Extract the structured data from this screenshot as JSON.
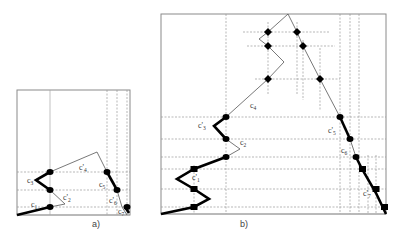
{
  "figure": {
    "panel_a": {
      "caption": "a)",
      "labels": [
        {
          "id": "c1",
          "text": "c",
          "sub": "1",
          "prime": false
        },
        {
          "id": "c2p",
          "text": "c'",
          "sub": "2",
          "prime": true
        },
        {
          "id": "c3",
          "text": "c",
          "sub": "3",
          "prime": false
        },
        {
          "id": "c4p",
          "text": "c'",
          "sub": "4",
          "prime": true
        },
        {
          "id": "c5",
          "text": "c",
          "sub": "5",
          "prime": false
        },
        {
          "id": "c6p",
          "text": "c'",
          "sub": "6",
          "prime": true
        },
        {
          "id": "c7",
          "text": "c",
          "sub": "7",
          "prime": false
        }
      ]
    },
    "panel_b": {
      "caption": "b)",
      "labels": [
        {
          "id": "c1p",
          "text": "c'",
          "sub": "1",
          "prime": true
        },
        {
          "id": "c2",
          "text": "c",
          "sub": "2",
          "prime": false
        },
        {
          "id": "c3p",
          "text": "c'",
          "sub": "3",
          "prime": true
        },
        {
          "id": "c4",
          "text": "c",
          "sub": "4",
          "prime": false
        },
        {
          "id": "c5p",
          "text": "c'",
          "sub": "5",
          "prime": true
        },
        {
          "id": "c6",
          "text": "c",
          "sub": "6",
          "prime": false
        },
        {
          "id": "c7p",
          "text": "c'",
          "sub": "7",
          "prime": true
        }
      ]
    },
    "colors": {
      "stroke": "#000000",
      "thin_stroke": "#555555",
      "grid": "#9a9a9a",
      "frame": "#8a8a8a"
    }
  }
}
